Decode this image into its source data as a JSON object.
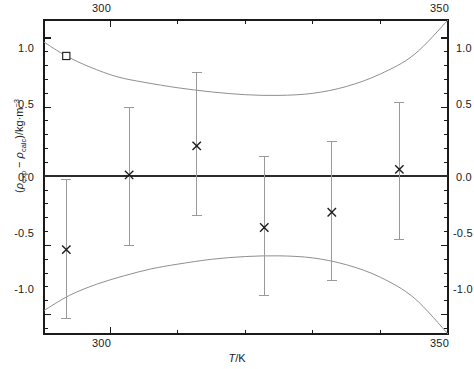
{
  "chart_data": {
    "type": "scatter",
    "title": "",
    "xlabel": "T/K",
    "ylabel": "(rho_exp - rho_calc)/kg*m^-3",
    "xlim": [
      290.2,
      350.0
    ],
    "ylim": [
      -1.14,
      1.13
    ],
    "grid": false,
    "legend": "none",
    "x_major_ticks": [
      300,
      350
    ],
    "x_major_tick_labels": [
      "300",
      "350"
    ],
    "x_minor_ticks": [
      290,
      310,
      320,
      330,
      340
    ],
    "y_major_ticks": [
      1.0,
      0.5,
      0.0,
      -0.5,
      -1.0
    ],
    "y_major_tick_labels": [
      "1.0",
      "0.5",
      "0.0",
      "-0.5",
      "-1.0"
    ],
    "y_minor_ticks": [
      0.9,
      0.8,
      0.7,
      0.6,
      0.4,
      0.3,
      0.2,
      0.1,
      -0.1,
      -0.2,
      -0.3,
      -0.4,
      -0.6,
      -0.7,
      -0.8,
      -0.9,
      -1.1
    ],
    "axes_mirrored": true,
    "zero_line": 0.0,
    "series": [
      {
        "name": "deviation-points",
        "marker": "x",
        "x": [
          293.5,
          302.8,
          312.8,
          322.8,
          332.8,
          342.8
        ],
        "y": [
          -0.53,
          0.01,
          0.22,
          -0.37,
          -0.26,
          0.05
        ],
        "yerr_lower": [
          -1.03,
          -0.5,
          -0.28,
          -0.86,
          -0.75,
          -0.46
        ],
        "yerr_upper": [
          -0.02,
          0.5,
          0.75,
          0.14,
          0.25,
          0.53
        ]
      },
      {
        "name": "outlier-point",
        "marker": "square",
        "x": [
          293.5
        ],
        "y": [
          0.87
        ]
      }
    ],
    "bands": [
      {
        "name": "upper-confidence-band",
        "x": [
          290.2,
          293.5,
          297,
          301,
          305,
          310,
          315,
          320,
          325,
          330,
          335,
          340,
          345,
          350
        ],
        "y": [
          0.97,
          0.87,
          0.79,
          0.72,
          0.68,
          0.64,
          0.61,
          0.59,
          0.585,
          0.6,
          0.65,
          0.74,
          0.88,
          1.13
        ]
      },
      {
        "name": "lower-confidence-band",
        "x": [
          290.2,
          294,
          298,
          302,
          306,
          310,
          315,
          320,
          325,
          330,
          335,
          340,
          345,
          350
        ],
        "y": [
          -0.97,
          -0.86,
          -0.78,
          -0.72,
          -0.67,
          -0.635,
          -0.6,
          -0.58,
          -0.575,
          -0.59,
          -0.64,
          -0.73,
          -0.88,
          -1.14
        ]
      }
    ],
    "colors": {
      "axis": "#1a1a1a",
      "zero_line": "#2b2b2b",
      "band_line": "#8f8f8f",
      "error_bar": "#9a9a9a",
      "marker": "#1a1a1a",
      "background": "#ffffff"
    }
  },
  "axes": {
    "y_title_part1": "(",
    "y_title_rho1": "ρ",
    "y_title_sub1": "exp",
    "y_title_minus": " − ",
    "y_title_rho2": "ρ",
    "y_title_sub2": "calc",
    "y_title_part2": ")/kg·m",
    "y_title_sup": "−3",
    "x_title_ital": "T",
    "x_title_rest": "/K"
  }
}
